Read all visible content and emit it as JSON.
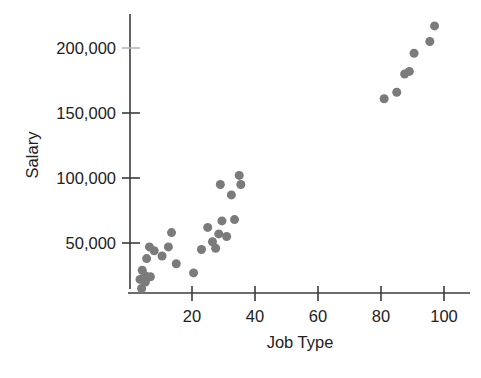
{
  "chart_data": {
    "type": "scatter",
    "title": "",
    "xlabel": "Job Type",
    "ylabel": "Salary",
    "xlim": [
      0,
      104
    ],
    "ylim": [
      0,
      230000
    ],
    "grid": false,
    "legend": "none",
    "marker_color": "#7b7b7b",
    "marker_size_px": 9,
    "xticks": [
      20,
      40,
      60,
      80,
      100
    ],
    "xtick_labels": [
      "20",
      "40",
      "60",
      "80",
      "100"
    ],
    "yticks": [
      50000,
      100000,
      150000,
      200000
    ],
    "ytick_labels": [
      "50,000",
      "100,000",
      "150,000",
      "200,000"
    ],
    "points": [
      {
        "x": 3.5,
        "y": 22000
      },
      {
        "x": 4.0,
        "y": 15000
      },
      {
        "x": 4.2,
        "y": 29000
      },
      {
        "x": 5.0,
        "y": 25000
      },
      {
        "x": 5.2,
        "y": 20000
      },
      {
        "x": 5.6,
        "y": 38000
      },
      {
        "x": 6.5,
        "y": 47000
      },
      {
        "x": 6.8,
        "y": 24000
      },
      {
        "x": 8.0,
        "y": 44000
      },
      {
        "x": 10.5,
        "y": 40000
      },
      {
        "x": 12.5,
        "y": 47000
      },
      {
        "x": 13.5,
        "y": 58000
      },
      {
        "x": 15.0,
        "y": 34000
      },
      {
        "x": 20.5,
        "y": 27000
      },
      {
        "x": 23.0,
        "y": 45000
      },
      {
        "x": 25.0,
        "y": 62000
      },
      {
        "x": 26.5,
        "y": 51000
      },
      {
        "x": 27.5,
        "y": 46000
      },
      {
        "x": 28.5,
        "y": 57000
      },
      {
        "x": 29.0,
        "y": 95000
      },
      {
        "x": 29.5,
        "y": 67000
      },
      {
        "x": 31.0,
        "y": 55000
      },
      {
        "x": 32.5,
        "y": 87000
      },
      {
        "x": 33.5,
        "y": 68000
      },
      {
        "x": 35.0,
        "y": 102000
      },
      {
        "x": 35.5,
        "y": 95000
      },
      {
        "x": 81.0,
        "y": 161000
      },
      {
        "x": 85.0,
        "y": 166000
      },
      {
        "x": 87.5,
        "y": 180000
      },
      {
        "x": 89.0,
        "y": 182000
      },
      {
        "x": 90.5,
        "y": 196000
      },
      {
        "x": 95.5,
        "y": 205000
      },
      {
        "x": 97.0,
        "y": 217000
      }
    ]
  },
  "axes": {
    "y_axis_label": "Salary",
    "x_axis_label": "Job Type"
  }
}
